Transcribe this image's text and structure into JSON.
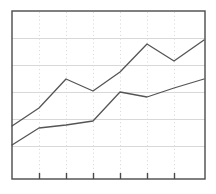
{
  "chart_data": {
    "type": "line",
    "title": "",
    "subtitle": "",
    "xlabel": "",
    "ylabel": "",
    "x": [
      0,
      1,
      2,
      3,
      4,
      5,
      6,
      7
    ],
    "tick_labels": [
      "",
      "",
      "",
      "",
      "",
      ""
    ],
    "xlim": [
      0,
      7
    ],
    "ylim": [
      0,
      6
    ],
    "grid": {
      "horizontal": true,
      "horizontal_count": 5,
      "horizontal_color": "#d8d8d8",
      "vertical": true,
      "vertical_style": "dotted",
      "vertical_count": 6,
      "vertical_color": "#dcdcdc"
    },
    "legend": "none",
    "axis_color": "#4a4a4a",
    "tick_count": 6,
    "series": [
      {
        "name": "Series 1",
        "color": "#555555",
        "values": [
          2.55,
          3.35,
          4.25,
          3.75,
          4.55,
          5.55,
          4.85,
          5.7
        ],
        "label": "upper-series"
      },
      {
        "name": "Series 2",
        "color": "#555555",
        "values": [
          1.85,
          2.6,
          2.75,
          2.95,
          3.7,
          3.5,
          3.85,
          4.25
        ],
        "label": "lower-series"
      }
    ],
    "geometry": {
      "plot_left": 12,
      "plot_top": 11,
      "plot_right": 205,
      "plot_bottom": 179,
      "gridlines_y": [
        38,
        65,
        92,
        119,
        146
      ],
      "ticks_x": [
        39,
        66,
        93,
        120,
        147,
        174
      ],
      "tick_length": 6,
      "series_points": [
        [
          [
            12,
            126
          ],
          [
            39,
            108
          ],
          [
            66,
            79
          ],
          [
            93,
            91
          ],
          [
            120,
            72
          ],
          [
            147,
            44
          ],
          [
            174,
            61
          ],
          [
            204,
            40
          ]
        ],
        [
          [
            12,
            145
          ],
          [
            39,
            128
          ],
          [
            66,
            125
          ],
          [
            93,
            121
          ],
          [
            120,
            92
          ],
          [
            147,
            97
          ],
          [
            174,
            88
          ],
          [
            204,
            79
          ]
        ]
      ]
    }
  }
}
